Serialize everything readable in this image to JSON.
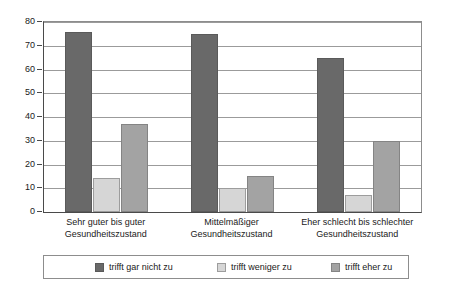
{
  "chart_data": {
    "type": "bar",
    "title": "",
    "subtitle": "",
    "xlabel": "",
    "ylabel": "",
    "ylim": [
      0,
      80
    ],
    "yticks": [
      0,
      10,
      20,
      30,
      40,
      50,
      60,
      70,
      80
    ],
    "ytick_labels": [
      "0",
      "10",
      "20",
      "30",
      "40",
      "50",
      "60",
      "70",
      "80"
    ],
    "grid": true,
    "legend_position": "bottom",
    "categories": [
      "Sehr guter bis guter\nGesundheitszustand",
      "Mittelmäßiger\nGesundheitszustand",
      "Eher schlecht bis schlechter\nGesundheitszustand"
    ],
    "category_lines": [
      [
        "Sehr guter bis guter",
        "Gesundheitszustand"
      ],
      [
        "Mittelmäßiger",
        "Gesundheitszustand"
      ],
      [
        "Eher schlecht bis schlechter",
        "Gesundheitszustand"
      ]
    ],
    "series": [
      {
        "name": "trifft gar nicht zu",
        "color": "#696969",
        "values": [
          76,
          75,
          65
        ]
      },
      {
        "name": "trifft weniger zu",
        "color": "#d6d6d6",
        "values": [
          14.5,
          10,
          7
        ]
      },
      {
        "name": "trifft eher zu",
        "color": "#a3a3a3",
        "values": [
          37,
          15,
          30
        ]
      }
    ]
  },
  "legend": {
    "items": [
      {
        "label": "trifft gar nicht zu",
        "color": "#696969"
      },
      {
        "label": "trifft weniger zu",
        "color": "#d6d6d6"
      },
      {
        "label": "trifft eher zu",
        "color": "#a3a3a3"
      }
    ]
  },
  "colors": {
    "series_dark": "#696969",
    "series_light": "#d6d6d6",
    "series_medium": "#a3a3a3",
    "axis": "#4a4a4a",
    "grid": "#9b9b9b",
    "text": "#1a1a1a",
    "background": "#ffffff"
  }
}
